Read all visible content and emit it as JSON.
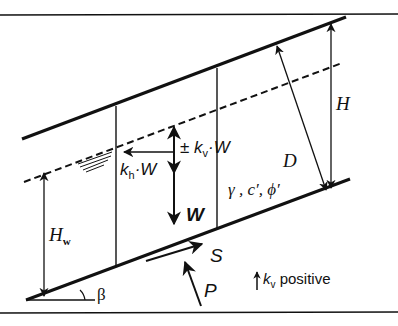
{
  "figure": {
    "type": "infinite-slope-stability-diagram",
    "elements": {
      "slope_surface": "ground surface",
      "failure_plane": "slip surface",
      "water_table": "phreatic surface (dashed)",
      "slice": "vertical slice of soil"
    },
    "labels": {
      "H": "H",
      "D": "D",
      "Hw": "H",
      "Hw_sub": "w",
      "beta": "β",
      "kv_pm": "± ",
      "kv_k": "k",
      "kv_sub": "v",
      "kv_W": "·W",
      "kh_k": "k",
      "kh_sub": "h",
      "kh_W": "·W",
      "W": "W",
      "soil_params": "γ , c′, ϕ′",
      "S": "S",
      "P": "P",
      "legend_k": "k",
      "legend_sub": "v",
      "legend_text": " positive"
    },
    "colors": {
      "ink": "#111111",
      "background": "#ffffff"
    }
  }
}
